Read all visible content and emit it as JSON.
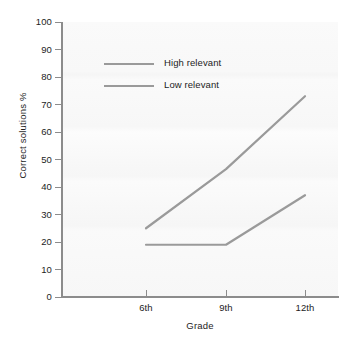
{
  "chart_data": {
    "type": "line",
    "title": "",
    "xlabel": "Grade",
    "ylabel": "Correct solutions %",
    "categories": [
      "6th",
      "9th",
      "12th"
    ],
    "ylim": [
      0,
      100
    ],
    "yticks": [
      0,
      10,
      20,
      30,
      40,
      50,
      60,
      70,
      80,
      90,
      100
    ],
    "ytick_labels": [
      "0",
      "10",
      "20",
      "30",
      "40",
      "50",
      "60",
      "70",
      "80",
      "90",
      "100"
    ],
    "grid": false,
    "legend_position": "upper-left-inside",
    "series": [
      {
        "name": "High relevant",
        "values": [
          25,
          46.5,
          73
        ],
        "color": "#9a9a9a"
      },
      {
        "name": "Low relevant",
        "values": [
          19,
          19,
          37
        ],
        "color": "#9a9a9a"
      }
    ]
  },
  "axis": {
    "y_title": "Correct solutions %",
    "x_title": "Grade"
  },
  "legend": {
    "items": [
      {
        "label": "High relevant"
      },
      {
        "label": "Low relevant"
      }
    ]
  },
  "colors": {
    "line": "#9a9a9a",
    "axis": "#8c8c8c",
    "plot_background": "#f8f8f8",
    "text": "#1d1d1d"
  }
}
